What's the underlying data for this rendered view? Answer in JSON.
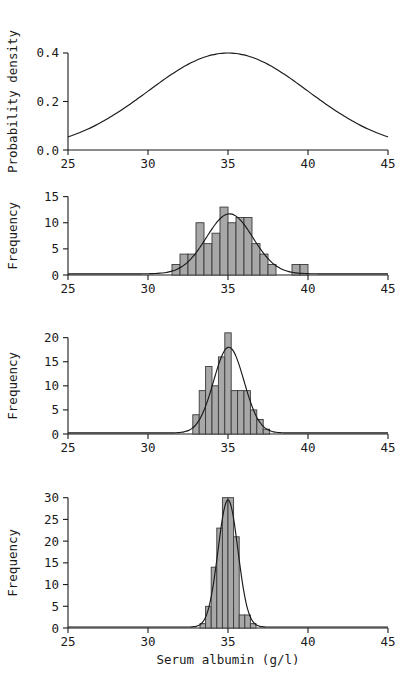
{
  "figure": {
    "width": 406,
    "height": 687,
    "background": "#ffffff",
    "bar_fill_color": "#a8a8a8",
    "bar_stroke_color": "#3a3a3a",
    "line_color": "#1a1a1a",
    "xlabel": "Serum albumin (g/l)"
  },
  "chart_data": [
    {
      "type": "line",
      "panel": 1,
      "title": "",
      "xlabel": "",
      "ylabel": "Probability density",
      "xlim": [
        25,
        45
      ],
      "ylim": [
        0.0,
        0.47
      ],
      "xticks": [
        25,
        30,
        35,
        40,
        45
      ],
      "xticklabels": [
        "25",
        "30",
        "35",
        "40",
        "45"
      ],
      "yticks": [
        0.0,
        0.2,
        0.4
      ],
      "yticklabels": [
        "0.0",
        "0.2",
        "0.4"
      ],
      "grid": false,
      "legend": "none",
      "series": [
        {
          "name": "Normal density (population)",
          "distribution": "normal",
          "mean": 35,
          "sd": 5.0,
          "peak_value": 0.4,
          "x": [
            25,
            26,
            27,
            28,
            29,
            30,
            31,
            32,
            33,
            34,
            35,
            36,
            37,
            38,
            39,
            40,
            41,
            42,
            43,
            44,
            45
          ],
          "values": [
            0.104,
            0.134,
            0.169,
            0.207,
            0.247,
            0.285,
            0.32,
            0.349,
            0.371,
            0.384,
            0.4,
            0.396,
            0.387,
            0.371,
            0.349,
            0.32,
            0.285,
            0.247,
            0.207,
            0.169,
            0.104
          ]
        }
      ]
    },
    {
      "type": "bar",
      "panel": 2,
      "title": "",
      "xlabel": "",
      "ylabel": "Frequency",
      "xlim": [
        25,
        45
      ],
      "ylim": [
        0,
        15.5
      ],
      "xticks": [
        25,
        30,
        35,
        40,
        45
      ],
      "xticklabels": [
        "25",
        "30",
        "35",
        "40",
        "45"
      ],
      "yticks": [
        0,
        5,
        10,
        15
      ],
      "yticklabels": [
        "0",
        "5",
        "10",
        "15"
      ],
      "grid": false,
      "legend": "none",
      "bin_width": 0.5,
      "bin_starts": [
        31.5,
        32.0,
        32.5,
        33.0,
        33.5,
        34.0,
        34.5,
        35.0,
        35.5,
        36.0,
        36.5,
        37.0,
        37.5,
        39.0,
        39.5
      ],
      "values": [
        2,
        4,
        4,
        10,
        6,
        8,
        13,
        10,
        11,
        11,
        6,
        4,
        2,
        2,
        2
      ],
      "overlay_curve": {
        "name": "Fitted normal curve",
        "distribution": "normal",
        "mean": 35.1,
        "sd": 1.45,
        "peak_value": 11.7,
        "x": [
          25,
          28,
          30,
          31,
          32,
          33,
          33.5,
          34,
          34.5,
          35,
          35.5,
          36,
          36.5,
          37,
          37.5,
          38,
          39,
          40,
          42,
          45
        ],
        "values": [
          0.2,
          0.25,
          0.5,
          1.1,
          2.3,
          5.0,
          7.0,
          9.2,
          11.0,
          11.7,
          11.4,
          10.0,
          7.6,
          5.1,
          3.0,
          1.7,
          0.6,
          0.3,
          0.25,
          0.25
        ]
      }
    },
    {
      "type": "bar",
      "panel": 3,
      "title": "",
      "xlabel": "",
      "ylabel": "Frequency",
      "xlim": [
        25,
        45
      ],
      "ylim": [
        0,
        22
      ],
      "xticks": [
        25,
        30,
        35,
        40,
        45
      ],
      "xticklabels": [
        "25",
        "30",
        "35",
        "40",
        "45"
      ],
      "yticks": [
        0,
        5,
        10,
        15,
        20
      ],
      "yticklabels": [
        "0",
        "5",
        "10",
        "15",
        "20"
      ],
      "grid": false,
      "legend": "none",
      "bin_width": 0.4,
      "bin_starts": [
        32.8,
        33.2,
        33.6,
        34.0,
        34.4,
        34.8,
        35.2,
        35.6,
        36.0,
        36.4,
        36.8,
        37.2
      ],
      "values": [
        4,
        9,
        14,
        10,
        16,
        21,
        9,
        9,
        9,
        5,
        3,
        1
      ],
      "overlay_curve": {
        "name": "Fitted normal curve",
        "distribution": "normal",
        "mean": 35.05,
        "sd": 0.95,
        "peak_value": 18.0,
        "x": [
          25,
          30,
          32,
          32.5,
          33,
          33.5,
          34,
          34.5,
          35,
          35.5,
          36,
          36.5,
          37,
          37.5,
          38,
          40,
          45
        ],
        "values": [
          0.2,
          0.25,
          0.7,
          1.4,
          3.0,
          6.3,
          11.0,
          15.6,
          18.0,
          16.6,
          12.3,
          7.3,
          3.5,
          1.4,
          0.6,
          0.25,
          0.25
        ]
      }
    },
    {
      "type": "bar",
      "panel": 4,
      "title": "",
      "xlabel": "Serum albumin (g/l)",
      "ylabel": "Frequency",
      "xlim": [
        25,
        45
      ],
      "ylim": [
        0,
        32
      ],
      "xticks": [
        25,
        30,
        35,
        40,
        45
      ],
      "xticklabels": [
        "25",
        "30",
        "35",
        "40",
        "45"
      ],
      "yticks": [
        0,
        5,
        10,
        15,
        20,
        25,
        30
      ],
      "yticklabels": [
        "0",
        "5",
        "10",
        "15",
        "20",
        "25",
        "30"
      ],
      "grid": false,
      "legend": "none",
      "bin_width": 0.35,
      "bin_starts": [
        33.25,
        33.6,
        33.95,
        34.3,
        34.65,
        35.0,
        35.35,
        35.7,
        36.05,
        36.4
      ],
      "values": [
        1,
        5,
        14,
        23,
        30,
        30,
        21,
        3,
        3,
        1
      ],
      "overlay_curve": {
        "name": "Fitted normal curve",
        "distribution": "normal",
        "mean": 35.0,
        "sd": 0.62,
        "peak_value": 29.5,
        "x": [
          25,
          31,
          32.5,
          33,
          33.4,
          33.8,
          34.2,
          34.6,
          35,
          35.4,
          35.8,
          36.2,
          36.6,
          37,
          37.5,
          40,
          45
        ],
        "values": [
          0.2,
          0.25,
          0.4,
          1.0,
          2.5,
          7.0,
          15.5,
          25.0,
          29.5,
          26.0,
          16.5,
          7.5,
          2.5,
          0.8,
          0.35,
          0.25,
          0.25
        ]
      }
    }
  ]
}
